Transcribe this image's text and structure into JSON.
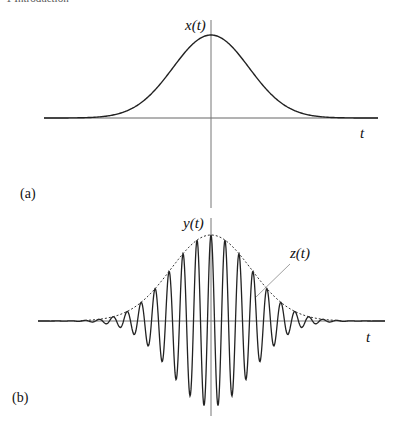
{
  "running_head": "1 Introduction",
  "figure": {
    "panels": [
      {
        "id": "a",
        "panel_label": "(a)",
        "y_label": "x(t)",
        "x_label": "t"
      },
      {
        "id": "b",
        "panel_label": "(b)",
        "y_label": "y(t)",
        "x_label": "t",
        "envelope_label": "z(t)"
      }
    ]
  },
  "chart_data": [
    {
      "type": "line",
      "title": "(a)",
      "xlabel": "t",
      "ylabel": "x(t)",
      "grid": false,
      "description": "Gaussian pulse centered at t=0",
      "series": [
        {
          "name": "x(t)",
          "function": "A*exp(-t^2/(2*sigma^2))",
          "A": 1.0,
          "sigma_px": 38,
          "center": 0
        }
      ],
      "axes": {
        "x_axis_px": {
          "y": 118,
          "x_from": 44,
          "x_to": 378
        },
        "y_axis_px": {
          "x": 211,
          "y_from": 20,
          "y_to": 208
        }
      },
      "amplitude_px": 83
    },
    {
      "type": "line",
      "title": "(b)",
      "xlabel": "t",
      "ylabel": "y(t)",
      "grid": false,
      "description": "Gaussian-modulated cosine carrier (solid) with Gaussian envelope z(t) (dashed)",
      "series": [
        {
          "name": "y(t)",
          "style": "solid",
          "function": "A*exp(-t^2/(2*sigma^2))*cos(2*pi*t/period)",
          "A": 1.0,
          "sigma_px": 40,
          "period_px": 14
        },
        {
          "name": "z(t)",
          "style": "dashed",
          "function": "A*exp(-t^2/(2*sigma^2))",
          "A": 1.0,
          "sigma_px": 40
        }
      ],
      "axes": {
        "x_axis_px": {
          "y": 321,
          "x_from": 38,
          "x_to": 385
        },
        "y_axis_px": {
          "x": 211,
          "y_from": 218,
          "y_to": 416
        }
      },
      "amplitude_px": 86,
      "annotations": [
        {
          "text": "z(t)",
          "points_to": "envelope",
          "leader_from": [
            290,
            264
          ],
          "leader_to": [
            256,
            297
          ]
        }
      ]
    }
  ]
}
